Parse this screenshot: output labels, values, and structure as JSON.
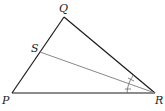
{
  "diagram": {
    "type": "triangle-angle-bisector",
    "vertices": {
      "P": {
        "label": "P",
        "x": 12,
        "y": 93
      },
      "Q": {
        "label": "Q",
        "x": 64,
        "y": 17
      },
      "R": {
        "label": "R",
        "x": 155,
        "y": 93
      },
      "S": {
        "label": "S",
        "x": 40,
        "y": 52
      }
    },
    "labels": {
      "P": "P",
      "Q": "Q",
      "R": "R",
      "S": "S"
    },
    "segments": [
      {
        "from": "P",
        "to": "Q",
        "color": "#1a1a1a"
      },
      {
        "from": "Q",
        "to": "R",
        "color": "#1a1a1a"
      },
      {
        "from": "P",
        "to": "R",
        "color": "#1a1a1a"
      },
      {
        "from": "S",
        "to": "R",
        "color": "#888888"
      }
    ],
    "angle_marks": {
      "vertex": "R",
      "description": "Two congruent angle marks indicating SR bisects angle QRP"
    }
  }
}
